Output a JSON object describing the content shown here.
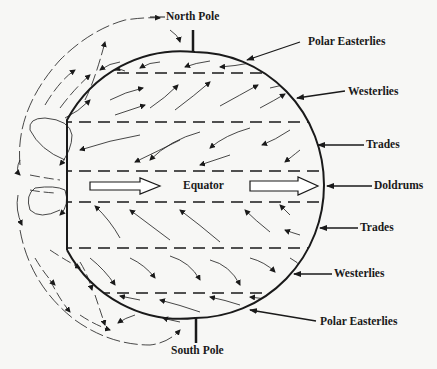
{
  "diagram": {
    "colors": {
      "ink": "#1a1a1a",
      "background": "#f7f7f5"
    },
    "poles": {
      "north": "North Pole",
      "south": "South Pole"
    },
    "equator_label": "Equator",
    "wind_belts_right": [
      {
        "id": "polar-easterlies-north",
        "label": "Polar Easterlies"
      },
      {
        "id": "westerlies-north",
        "label": "Westerlies"
      },
      {
        "id": "trades-north",
        "label": "Trades"
      },
      {
        "id": "doldrums",
        "label": "Doldrums"
      },
      {
        "id": "trades-south",
        "label": "Trades"
      },
      {
        "id": "westerlies-south",
        "label": "Westerlies"
      },
      {
        "id": "polar-easterlies-south",
        "label": "Polar Easterlies"
      }
    ]
  }
}
